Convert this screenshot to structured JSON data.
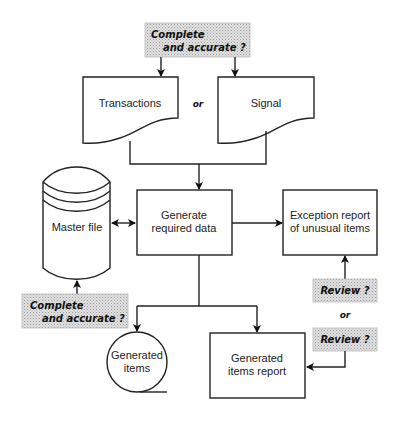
{
  "diagram": {
    "top_callout": {
      "line1": "Complete",
      "line2": "and accurate ?"
    },
    "inputs": {
      "transactions": "Transactions",
      "or": "or",
      "signal": "Signal"
    },
    "master_file": "Master file",
    "master_callout": {
      "line1": "Complete",
      "line2": "and accurate ?"
    },
    "process": {
      "line1": "Generate",
      "line2": "required data"
    },
    "exception_report": {
      "line1": "Exception report",
      "line2": "of unusual items"
    },
    "review_callouts": {
      "review1": "Review ?",
      "or": "or",
      "review2": "Review ?"
    },
    "generated_items": {
      "line1": "Generated",
      "line2": "items"
    },
    "generated_items_report": {
      "line1": "Generated",
      "line2": "items report"
    }
  }
}
